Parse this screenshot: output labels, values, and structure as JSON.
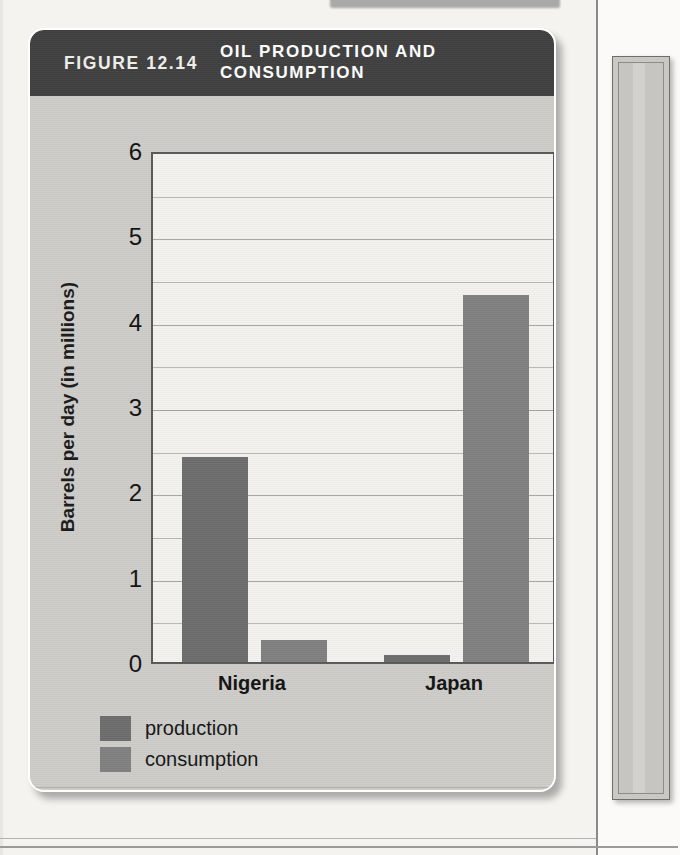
{
  "figure": {
    "number": "FIGURE 12.14",
    "title": "OIL PRODUCTION AND CONSUMPTION",
    "source": "Source: U.S. Energy Information Administration",
    "header_bg": "#3f3f3f",
    "card_bg": "#cdccc8"
  },
  "chart_data": {
    "type": "bar",
    "title": "OIL PRODUCTION AND CONSUMPTION",
    "xlabel": "",
    "ylabel": "Barrels per day (in millions)",
    "categories": [
      "Nigeria",
      "Japan"
    ],
    "series": [
      {
        "name": "production",
        "color": "#6d6d6d",
        "values": [
          2.4,
          0.08
        ]
      },
      {
        "name": "consumption",
        "color": "#808080",
        "values": [
          0.26,
          4.3
        ]
      }
    ],
    "ylim": [
      0,
      6
    ],
    "yticks": [
      0,
      1,
      2,
      3,
      4,
      5,
      6
    ],
    "ytick_labels": [
      "0",
      "1",
      "2",
      "3",
      "4",
      "5",
      "6"
    ],
    "gridlines": [
      0.5,
      1,
      1.5,
      2,
      2.5,
      3,
      3.5,
      4,
      4.5,
      5,
      5.5
    ],
    "grid": true,
    "legend_position": "below-left",
    "source": "Source: U.S. Energy Information Administration"
  }
}
